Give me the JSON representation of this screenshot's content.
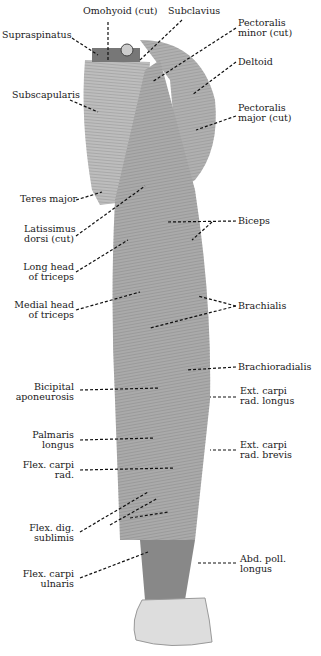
{
  "figure": {
    "labels_left": [
      {
        "id": "supraspinatus",
        "text": "Supraspinatus",
        "x": 2,
        "y": 34
      },
      {
        "id": "subscapularis",
        "text": "Subscapularis",
        "x": 12,
        "y": 93
      },
      {
        "id": "teres-major",
        "text": "Teres major",
        "x": 20,
        "y": 198
      },
      {
        "id": "latissimus-dorsi",
        "text": "Latissimus\ndorsi (cut)",
        "x": 24,
        "y": 226
      },
      {
        "id": "long-head-triceps",
        "text": "Long head\nof triceps",
        "x": 26,
        "y": 263
      },
      {
        "id": "medial-head-triceps",
        "text": "Medial head\nof triceps",
        "x": 20,
        "y": 302
      },
      {
        "id": "bicipital-aponeurosis",
        "text": "Bicipital\naponeurosis",
        "x": 20,
        "y": 384
      },
      {
        "id": "palmaris-longus",
        "text": "Palmaris\nlongus",
        "x": 36,
        "y": 430
      },
      {
        "id": "flex-carpi-rad",
        "text": "Flex. carpi\nrad.",
        "x": 28,
        "y": 460
      },
      {
        "id": "flex-dig-sublimis",
        "text": "Flex. dig.\nsublimis",
        "x": 34,
        "y": 523
      },
      {
        "id": "flex-carpi-ulnaris",
        "text": "Flex. carpi\nulnaris",
        "x": 28,
        "y": 569
      }
    ],
    "labels_top": [
      {
        "id": "omohyoid",
        "text": "Omohyoid (cut)",
        "x": 83,
        "y": 9
      },
      {
        "id": "subclavius",
        "text": "Subclavius",
        "x": 168,
        "y": 9
      }
    ],
    "labels_right": [
      {
        "id": "pectoralis-minor",
        "text": "Pectoralis\nminor (cut)",
        "x": 238,
        "y": 22
      },
      {
        "id": "deltoid",
        "text": "Deltoid",
        "x": 238,
        "y": 58
      },
      {
        "id": "pectoralis-major",
        "text": "Pectoralis\nmajor (cut)",
        "x": 238,
        "y": 103
      },
      {
        "id": "biceps",
        "text": "Biceps",
        "x": 238,
        "y": 216
      },
      {
        "id": "brachialis",
        "text": "Brachialis",
        "x": 238,
        "y": 301
      },
      {
        "id": "brachioradialis",
        "text": "Brachioradialis",
        "x": 238,
        "y": 362
      },
      {
        "id": "ext-carpi-rad-longus",
        "text": "Ext. carpi\nrad. longus",
        "x": 240,
        "y": 386
      },
      {
        "id": "ext-carpi-rad-brevis",
        "text": "Ext. carpi\nrad. brevis",
        "x": 240,
        "y": 440
      },
      {
        "id": "abd-poll-longus",
        "text": "Abd. poll.\nlongus",
        "x": 240,
        "y": 554
      }
    ]
  }
}
